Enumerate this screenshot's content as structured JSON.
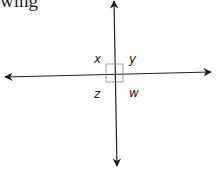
{
  "header": {
    "text_fragment": "wing"
  },
  "diagram": {
    "type": "perpendicular-lines",
    "right_angle_marker": true,
    "line_color": "#222222",
    "marker_color": "#888888",
    "angle_labels": {
      "top_left": "x",
      "top_right": "y",
      "bottom_left": "z",
      "bottom_right": "w"
    }
  }
}
